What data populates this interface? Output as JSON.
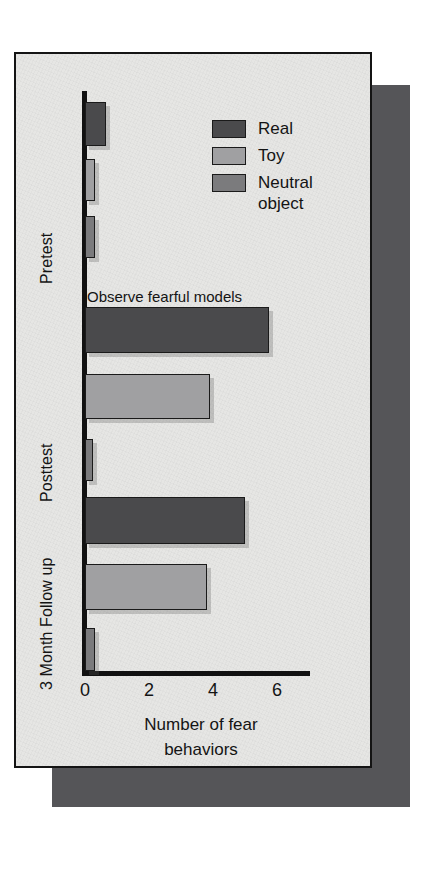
{
  "figure": {
    "panel_bg": "#e6e6e4",
    "shadow_color": "#555558",
    "axis_color": "#141414"
  },
  "legend": {
    "position": "inside-top-right",
    "items": [
      {
        "label": "Real",
        "color": "#4a4a4c",
        "swatch_name": "legend-swatch-real"
      },
      {
        "label": "Toy",
        "color": "#a0a0a2",
        "swatch_name": "legend-swatch-toy"
      },
      {
        "label": "Neutral\nobject",
        "color": "#7b7b7d",
        "swatch_name": "legend-swatch-neutral"
      }
    ]
  },
  "annotation": {
    "text": "Observe fearful models"
  },
  "axis": {
    "x_title_line1": "Number of fear",
    "x_title_line2": "behaviors",
    "ticks": [
      "0",
      "2",
      "4",
      "6"
    ]
  },
  "groups": [
    {
      "label": "Pretest"
    },
    {
      "label": "Posttest"
    },
    {
      "label": "3 Month Follow up"
    }
  ],
  "chart_data": {
    "type": "bar",
    "orientation": "horizontal",
    "title": "",
    "subtitle": "",
    "xlabel": "Number of fear behaviors",
    "ylabel": "",
    "categories": [
      "Pretest",
      "Posttest",
      "3 Month Follow up"
    ],
    "series": [
      {
        "name": "Real",
        "color": "#4a4a4c",
        "values": [
          0.65,
          5.75,
          5.0
        ]
      },
      {
        "name": "Toy",
        "color": "#a0a0a2",
        "values": [
          0.3,
          3.9,
          3.8
        ]
      },
      {
        "name": "Neutral object",
        "color": "#7b7b7d",
        "values": [
          0.3,
          0.25,
          0.3
        ]
      }
    ],
    "xlim": [
      0,
      7.1
    ],
    "xticks": [
      0,
      2,
      4,
      6
    ],
    "grid": false,
    "legend_position": "upper right",
    "annotations": [
      {
        "text": "Observe fearful models",
        "between": [
          "Pretest",
          "Posttest"
        ]
      }
    ]
  }
}
